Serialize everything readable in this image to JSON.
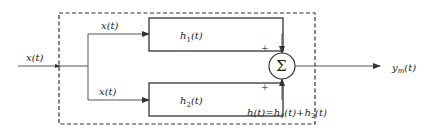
{
  "diagram": {
    "type": "block-diagram",
    "input": {
      "label": "x(t)"
    },
    "branch_top": {
      "label": "x(t)"
    },
    "branch_bottom": {
      "label": "x(t)"
    },
    "blocks": [
      {
        "id": "h1",
        "label": "h",
        "subscript": "1",
        "suffix": "(t)"
      },
      {
        "id": "h2",
        "label": "h",
        "subscript": "2",
        "suffix": "(t)"
      }
    ],
    "summer": {
      "symbol": "Σ",
      "top_sign": "+",
      "bottom_sign": "+"
    },
    "output": {
      "label": "y",
      "subscript": "m",
      "suffix": "(t)"
    },
    "equivalent": {
      "text_prefix": "h(t)=h",
      "sub1": "1",
      "mid": "(t)+h",
      "sub2": "2",
      "end": "(t)"
    }
  }
}
